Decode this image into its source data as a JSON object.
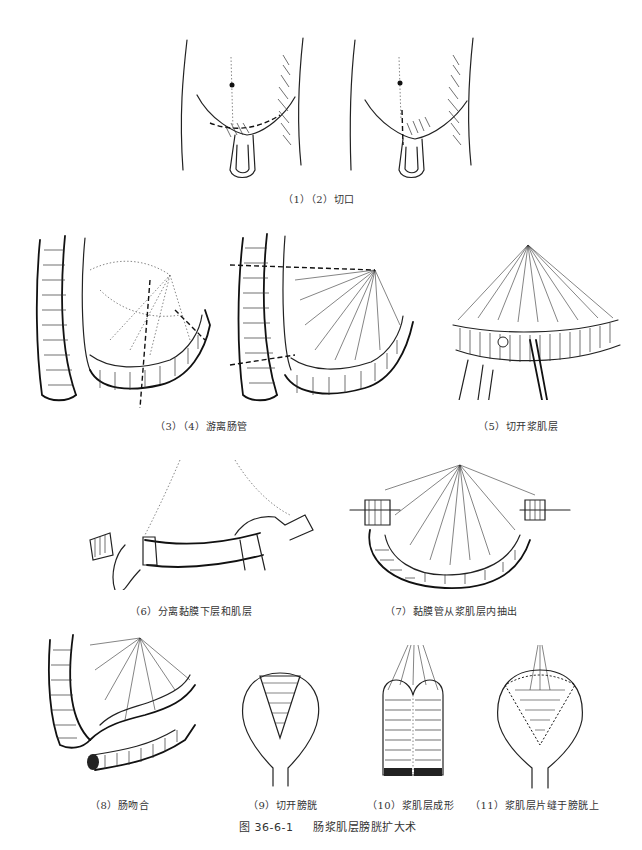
{
  "figure": {
    "number": "图 36-6-1",
    "title": "肠浆肌层膀胱扩大术",
    "panels": [
      {
        "id": "1-2",
        "caption": "（1）（2）切口",
        "depicts": "lower abdomen with incision lines"
      },
      {
        "id": "3-4",
        "caption": "（3）（4）游离肠管",
        "depicts": "mobilization of intestinal segment with mesentery"
      },
      {
        "id": "5",
        "caption": "（5）切开浆肌层",
        "depicts": "incising the seromuscular layer"
      },
      {
        "id": "6",
        "caption": "（6）分离黏膜下层和肌层",
        "depicts": "separating submucosa from muscle layer"
      },
      {
        "id": "7",
        "caption": "（7）黏膜管从浆肌层内抽出",
        "depicts": "mucosal tube withdrawn from seromuscular layer"
      },
      {
        "id": "8",
        "caption": "（8）肠吻合",
        "depicts": "intestinal anastomosis"
      },
      {
        "id": "9",
        "caption": "（9）切开膀胱",
        "depicts": "opening the bladder"
      },
      {
        "id": "10",
        "caption": "（10）浆肌层成形",
        "depicts": "shaping the seromuscular patch"
      },
      {
        "id": "11",
        "caption": "（11）浆肌层片缝于膀胱上",
        "depicts": "seromuscular patch sutured onto bladder"
      }
    ]
  }
}
